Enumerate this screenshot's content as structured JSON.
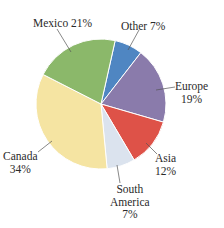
{
  "chart_data": {
    "type": "pie",
    "title": "",
    "categories": [
      "Other",
      "Europe",
      "Asia",
      "South America",
      "Canada",
      "Mexico"
    ],
    "values": [
      7,
      19,
      12,
      7,
      34,
      21
    ],
    "unit": "%",
    "colors": [
      "#4f86c2",
      "#8a7bab",
      "#de5248",
      "#dbe3ee",
      "#f5e4a2",
      "#8bb86a"
    ],
    "start_angle_deg_clockwise_from_top": 12.6,
    "labels": [
      {
        "name": "Other",
        "lines": [
          "Other 7%"
        ]
      },
      {
        "name": "Europe",
        "lines": [
          "Europe",
          "19%"
        ]
      },
      {
        "name": "Asia",
        "lines": [
          "Asia",
          "12%"
        ]
      },
      {
        "name": "South America",
        "lines": [
          "South",
          "America",
          "7%"
        ]
      },
      {
        "name": "Canada",
        "lines": [
          "Canada",
          "34%"
        ]
      },
      {
        "name": "Mexico",
        "lines": [
          "Mexico 21%"
        ]
      }
    ],
    "legend": "none (callout labels with leader lines)"
  }
}
